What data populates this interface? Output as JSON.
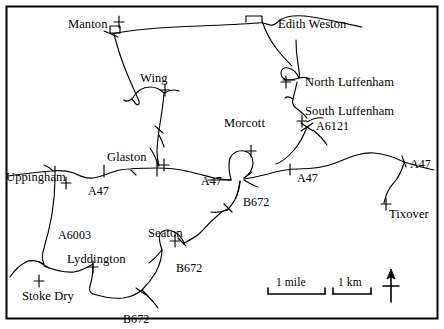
{
  "map": {
    "border_color": "#000000",
    "ink_color": "#000000",
    "background_color": "#ffffff",
    "settlements": [
      {
        "name": "Manton",
        "x": 68,
        "y": 18,
        "marker": "church-cross"
      },
      {
        "name": "Edith Weston",
        "x": 278,
        "y": 18,
        "marker": "village-block"
      },
      {
        "name": "Wing",
        "x": 140,
        "y": 72,
        "marker": "church-cross"
      },
      {
        "name": "North Luffenham",
        "x": 305,
        "y": 76,
        "marker": "church-cross"
      },
      {
        "name": "South Luffenham",
        "x": 305,
        "y": 105,
        "marker": "church-cross"
      },
      {
        "name": "Glaston",
        "x": 107,
        "y": 151,
        "marker": "church-cross"
      },
      {
        "name": "Morcott",
        "x": 224,
        "y": 117,
        "marker": "church-cross"
      },
      {
        "name": "Uppingham",
        "x": 6,
        "y": 171,
        "marker": "church-cross"
      },
      {
        "name": "Seaton",
        "x": 148,
        "y": 227,
        "marker": "church-cross"
      },
      {
        "name": "Lyddington",
        "x": 67,
        "y": 253,
        "marker": "church-cross"
      },
      {
        "name": "Stoke Dry",
        "x": 22,
        "y": 290,
        "marker": "church-cross"
      },
      {
        "name": "Tixover",
        "x": 389,
        "y": 208,
        "marker": "church-cross"
      }
    ],
    "road_labels": [
      {
        "name": "A6121",
        "x": 316,
        "y": 120
      },
      {
        "name": "A47",
        "x": 88,
        "y": 185
      },
      {
        "name": "A47",
        "x": 201,
        "y": 175
      },
      {
        "name": "A47",
        "x": 297,
        "y": 172
      },
      {
        "name": "A47",
        "x": 410,
        "y": 158
      },
      {
        "name": "A6003",
        "x": 58,
        "y": 229
      },
      {
        "name": "B672",
        "x": 243,
        "y": 196
      },
      {
        "name": "B672",
        "x": 176,
        "y": 262
      },
      {
        "name": "B672",
        "x": 123,
        "y": 313
      }
    ],
    "scale": {
      "mile": {
        "label": "1 mile",
        "bar_x": 268,
        "bar_y": 290,
        "bar_width": 57
      },
      "km": {
        "label": "1 km",
        "bar_x": 333,
        "bar_y": 290,
        "bar_width": 38
      }
    },
    "north_arrow": {
      "label": "",
      "x": 390,
      "y": 280
    }
  }
}
